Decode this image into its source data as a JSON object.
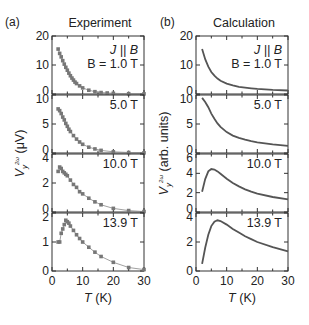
{
  "chart_data": [
    {
      "type": "scatter",
      "panel_label": "(a)",
      "title": "Experiment",
      "xlabel": "T (K)",
      "ylabel": "V_y^2ω (μV)",
      "xlim": [
        0,
        30
      ],
      "xticks": [
        0,
        10,
        20,
        30
      ],
      "annotation": "J || B",
      "subplots": [
        {
          "label": "B = 1.0 T",
          "ylim": [
            0,
            20
          ],
          "yticks": [
            0,
            10,
            20
          ],
          "x": [
            2,
            2.5,
            3,
            3.5,
            4,
            4.5,
            5,
            5.5,
            6,
            6.5,
            7,
            7.5,
            8,
            9,
            10,
            12,
            14,
            16,
            18,
            20,
            25,
            30
          ],
          "y": [
            15.5,
            14.0,
            12.8,
            11.5,
            10.3,
            9.2,
            8.2,
            7.2,
            6.3,
            5.5,
            4.8,
            4.1,
            3.6,
            2.8,
            2.1,
            1.3,
            0.8,
            0.5,
            0.35,
            0.25,
            0.1,
            0.05
          ]
        },
        {
          "label": "5.0 T",
          "ylim": [
            0,
            10
          ],
          "yticks": [
            0,
            5,
            10
          ],
          "x": [
            2,
            2.5,
            3,
            3.5,
            4,
            4.5,
            5,
            5.5,
            6,
            7,
            8,
            9,
            10,
            12,
            14,
            16,
            20,
            25,
            30
          ],
          "y": [
            7.6,
            7.3,
            6.8,
            6.2,
            5.7,
            5.1,
            4.6,
            4.1,
            3.7,
            3.0,
            2.4,
            1.9,
            1.5,
            1.0,
            0.7,
            0.45,
            0.2,
            0.08,
            0.03
          ]
        },
        {
          "label": "10.0 T",
          "ylim": [
            0,
            4
          ],
          "yticks": [
            0,
            2,
            4
          ],
          "x": [
            2,
            2.5,
            3,
            3.5,
            4,
            4.5,
            5,
            6,
            7,
            8,
            9,
            10,
            12,
            14,
            16,
            20,
            25,
            30
          ],
          "y": [
            2.8,
            3.1,
            3.0,
            2.8,
            2.7,
            2.6,
            2.5,
            2.2,
            1.9,
            1.7,
            1.4,
            1.25,
            0.95,
            0.7,
            0.5,
            0.25,
            0.1,
            0.03
          ]
        },
        {
          "label": "13.9 T",
          "ylim": [
            0,
            2
          ],
          "yticks": [
            0,
            1,
            2
          ],
          "x": [
            2,
            2.5,
            3,
            3.5,
            4,
            4.5,
            5,
            5.5,
            6,
            7,
            8,
            9,
            10,
            12,
            14,
            16,
            20,
            25,
            30
          ],
          "y": [
            1.0,
            1.0,
            1.3,
            1.45,
            1.6,
            1.75,
            1.7,
            1.65,
            1.55,
            1.4,
            1.25,
            1.12,
            1.0,
            0.82,
            0.65,
            0.5,
            0.3,
            0.12,
            0.05
          ]
        }
      ]
    },
    {
      "type": "line",
      "panel_label": "(b)",
      "title": "Calculation",
      "xlabel": "T (K)",
      "ylabel": "V_y^2ω (arb. units)",
      "xlim": [
        0,
        30
      ],
      "xticks": [
        0,
        10,
        20,
        30
      ],
      "annotation": "J || B",
      "subplots": [
        {
          "label": "B = 1.0 T",
          "ylim": [
            0,
            20
          ],
          "yticks": [
            0,
            10,
            20
          ],
          "x": [
            2,
            3,
            4,
            5,
            6,
            7,
            8,
            10,
            12,
            14,
            16,
            18,
            20,
            25,
            30
          ],
          "y": [
            15.5,
            12.0,
            9.4,
            7.6,
            6.3,
            5.3,
            4.6,
            3.6,
            3.0,
            2.5,
            2.2,
            1.95,
            1.75,
            1.4,
            1.2
          ]
        },
        {
          "label": "5.0 T",
          "ylim": [
            0,
            10
          ],
          "yticks": [
            0,
            5,
            10
          ],
          "x": [
            2,
            3,
            4,
            5,
            6,
            7,
            8,
            10,
            12,
            14,
            16,
            18,
            20,
            25,
            30
          ],
          "y": [
            9.5,
            8.8,
            7.9,
            6.8,
            5.9,
            5.1,
            4.5,
            3.6,
            3.0,
            2.6,
            2.3,
            2.05,
            1.85,
            1.5,
            1.25
          ]
        },
        {
          "label": "10.0 T",
          "ylim": [
            0,
            6
          ],
          "yticks": [
            0,
            2,
            4,
            6
          ],
          "x": [
            2,
            3,
            4,
            5,
            6,
            7,
            8,
            10,
            12,
            14,
            16,
            18,
            20,
            25,
            30
          ],
          "y": [
            2.1,
            3.4,
            4.2,
            4.45,
            4.4,
            4.2,
            3.95,
            3.45,
            3.0,
            2.65,
            2.35,
            2.1,
            1.9,
            1.55,
            1.3
          ]
        },
        {
          "label": "13.9 T",
          "ylim": [
            0,
            4
          ],
          "yticks": [
            0,
            2,
            4
          ],
          "x": [
            2,
            3,
            4,
            5,
            6,
            7,
            8,
            10,
            12,
            14,
            16,
            18,
            20,
            25,
            30
          ],
          "y": [
            0.5,
            1.6,
            2.5,
            3.1,
            3.4,
            3.5,
            3.45,
            3.2,
            2.9,
            2.65,
            2.4,
            2.2,
            2.0,
            1.65,
            1.35
          ]
        }
      ]
    }
  ]
}
